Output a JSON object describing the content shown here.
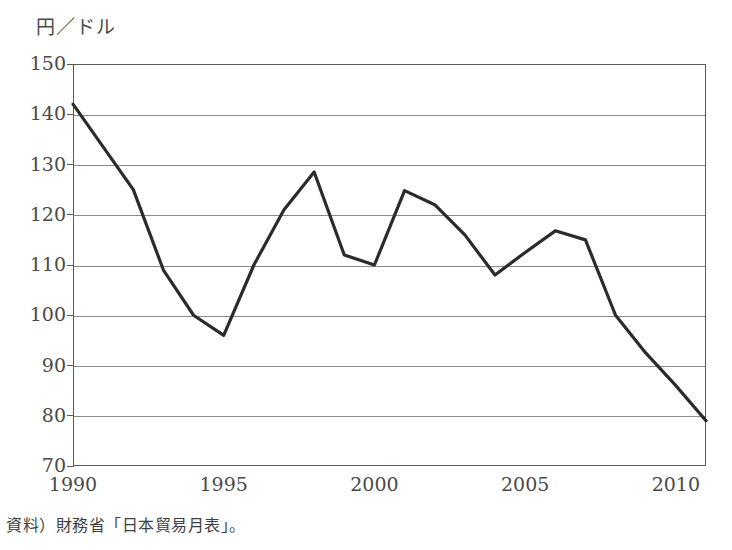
{
  "axis_label_y": "円／ドル",
  "source_note": "資料）財務省「日本貿易月表」。",
  "y_ticks": [
    "150",
    "140",
    "130",
    "120",
    "110",
    "100",
    "90",
    "80",
    "70"
  ],
  "x_ticks": [
    "1990",
    "1995",
    "2000",
    "2005",
    "2010"
  ],
  "line_color": "#2b2b2b",
  "grid_color": "#8a8a8a",
  "chart_data": {
    "type": "line",
    "title": "",
    "subtitle": "",
    "xlabel": "",
    "ylabel": "円／ドル",
    "ylim": [
      70,
      150
    ],
    "xlim": [
      1990,
      2011
    ],
    "ytick_step": 10,
    "grid": "horizontal",
    "legend": "none",
    "annotations": [],
    "x": [
      1990,
      1991,
      1992,
      1993,
      1994,
      1995,
      1996,
      1997,
      1998,
      1999,
      2000,
      2001,
      2002,
      2003,
      2004,
      2005,
      2006,
      2007,
      2008,
      2009,
      2010,
      2011
    ],
    "series": [
      {
        "name": "円／ドル為替レート",
        "values": [
          142.0,
          133.5,
          125.0,
          109.0,
          100.0,
          96.0,
          110.0,
          121.0,
          128.5,
          112.0,
          110.0,
          124.8,
          122.0,
          116.0,
          108.0,
          112.5,
          116.8,
          115.0,
          100.0,
          92.5,
          86.0,
          79.0
        ]
      }
    ]
  }
}
